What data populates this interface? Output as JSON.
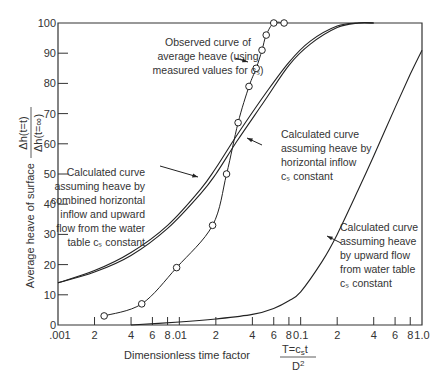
{
  "chart_data": {
    "type": "line",
    "title": "",
    "xlabel": "Dimensionless time factor",
    "xlabel_fraction": {
      "numerator": "T=c",
      "numerator_sub": "s",
      "numerator_tail": "t",
      "denominator": "D",
      "denominator_sup": "2"
    },
    "ylabel": "Average heave of surface",
    "ylabel_fraction": {
      "numerator": "Δh(t=t)",
      "denominator": "Δh(t=∞)"
    },
    "xscale": "log",
    "xlim": [
      0.001,
      1.0
    ],
    "ylim": [
      0,
      100
    ],
    "grid": false,
    "x_tick_labels": [
      ".001",
      "2",
      "4",
      "6",
      "8",
      ".01",
      "2",
      "4",
      "6",
      "8",
      "0.1",
      "2",
      "4",
      "6",
      "8",
      "1.0"
    ],
    "x_tick_values": [
      0.001,
      0.002,
      0.004,
      0.006,
      0.008,
      0.01,
      0.02,
      0.04,
      0.06,
      0.08,
      0.1,
      0.2,
      0.4,
      0.6,
      0.8,
      1.0
    ],
    "y_tick_labels": [
      "0",
      "10",
      "20",
      "30",
      "40",
      "50",
      "60",
      "70",
      "80",
      "90",
      "100"
    ],
    "y_tick_values": [
      0,
      10,
      20,
      30,
      40,
      50,
      60,
      70,
      80,
      90,
      100
    ],
    "series": [
      {
        "name": "Observed curve of average heave (using measured values for cs)",
        "markers": "open-circle",
        "x": [
          0.0024,
          0.0049,
          0.0095,
          0.0188,
          0.0245,
          0.0305,
          0.0375,
          0.043,
          0.048,
          0.052,
          0.06,
          0.073
        ],
        "y": [
          3,
          7,
          19,
          33,
          50,
          67,
          79,
          85,
          91,
          96,
          100,
          100
        ]
      },
      {
        "name": "Calculated curve assuming heave by combined horizontal inflow and upward flow from the water table cs constant",
        "x": [
          0.001,
          0.002,
          0.004,
          0.008,
          0.015,
          0.02,
          0.03,
          0.05,
          0.08,
          0.12,
          0.2,
          0.3,
          0.4
        ],
        "y": [
          14,
          18,
          24,
          33,
          45,
          52,
          63,
          76,
          87,
          94,
          99,
          100,
          100
        ]
      },
      {
        "name": "Calculated curve assuming heave by horizontal inflow cs constant",
        "x": [
          0.001,
          0.002,
          0.004,
          0.008,
          0.015,
          0.02,
          0.03,
          0.05,
          0.08,
          0.12,
          0.2,
          0.3,
          0.4
        ],
        "y": [
          14,
          17.5,
          23,
          32,
          43.5,
          50,
          61,
          74,
          86,
          93,
          98.5,
          100,
          100
        ]
      },
      {
        "name": "Calculated curve assuming heave by upward flow from water table cs constant",
        "x": [
          0.004,
          0.01,
          0.02,
          0.04,
          0.06,
          0.08,
          0.1,
          0.15,
          0.2,
          0.3,
          0.4,
          0.6,
          0.8,
          1.0
        ],
        "y": [
          0,
          1,
          2,
          3.5,
          5.5,
          8,
          11,
          21,
          30,
          45,
          56,
          72,
          83,
          91
        ]
      }
    ],
    "annotations": [
      {
        "lines": [
          "Observed curve of",
          "average heave (using",
          "measured values for cₛ)"
        ]
      },
      {
        "lines": [
          "Calculated curve",
          "assuming heave by",
          "horizontal inflow",
          "cₛ constant"
        ]
      },
      {
        "lines": [
          "Calculated curve",
          "assuming heave by",
          "combined horizontal",
          "inflow and upward",
          "flow from the water",
          "table cₛ constant"
        ]
      },
      {
        "lines": [
          "Calculated curve",
          "assuming heave",
          "by upward flow",
          "from water table",
          "cₛ constant"
        ]
      }
    ],
    "legend": "none (inline annotations with arrows)"
  }
}
